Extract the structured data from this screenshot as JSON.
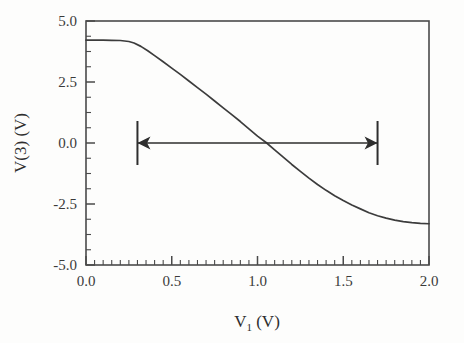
{
  "chart_data": {
    "type": "line",
    "title": "",
    "xlabel": "V1 (V)",
    "xlabel_base": "V",
    "xlabel_sub": "1",
    "xlabel_unit": " (V)",
    "ylabel": "V(3) (V)",
    "xlim": [
      0.0,
      2.0
    ],
    "ylim": [
      -5.0,
      5.0
    ],
    "grid": false,
    "legend": "none",
    "xticks": [
      "0.0",
      "0.5",
      "1.0",
      "1.5",
      "2.0"
    ],
    "xtick_values": [
      0.0,
      0.5,
      1.0,
      1.5,
      2.0
    ],
    "x_minor_step": 0.05,
    "yticks": [
      "5.0",
      "2.5",
      "0.0",
      "-2.5",
      "-5.0"
    ],
    "ytick_values": [
      5.0,
      2.5,
      0.0,
      -2.5,
      -5.0
    ],
    "y_minor_step": 0.625,
    "series": [
      {
        "name": "V(3)",
        "color": "#3c3c3c",
        "x": [
          0.0,
          0.05,
          0.1,
          0.15,
          0.2,
          0.25,
          0.28,
          0.32,
          0.36,
          0.4,
          0.45,
          0.5,
          0.55,
          0.6,
          0.65,
          0.7,
          0.75,
          0.8,
          0.85,
          0.9,
          0.95,
          1.0,
          1.05,
          1.1,
          1.15,
          1.2,
          1.25,
          1.3,
          1.35,
          1.4,
          1.45,
          1.5,
          1.55,
          1.6,
          1.65,
          1.7,
          1.75,
          1.8,
          1.85,
          1.9,
          1.95,
          2.0
        ],
        "y": [
          4.22,
          4.22,
          4.22,
          4.21,
          4.2,
          4.16,
          4.1,
          3.96,
          3.78,
          3.58,
          3.33,
          3.07,
          2.81,
          2.54,
          2.27,
          2.0,
          1.72,
          1.44,
          1.16,
          0.88,
          0.58,
          0.28,
          0.02,
          -0.28,
          -0.58,
          -0.88,
          -1.16,
          -1.44,
          -1.7,
          -1.94,
          -2.16,
          -2.36,
          -2.54,
          -2.7,
          -2.86,
          -2.98,
          -3.08,
          -3.16,
          -3.22,
          -3.26,
          -3.29,
          -3.31
        ]
      }
    ],
    "annotations": [
      {
        "type": "double-arrow",
        "label": "",
        "x_start": 0.3,
        "x_end": 1.7,
        "y": 0.0,
        "color": "#2e2e2e",
        "end_bars": true
      }
    ]
  },
  "axes": {
    "frame_color": "#4a4a4a",
    "tick_color": "#4a4a4a"
  }
}
